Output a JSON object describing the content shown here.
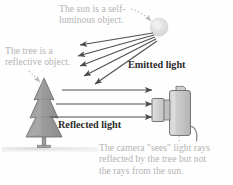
{
  "figure": {
    "background_color": "#fefefe"
  },
  "captions": {
    "sun": "The sun is a self-\nluminous object.",
    "tree": "The tree is a\nreflective object.",
    "camera": "The camera \"sees\" light rays\nreflected by the tree but not\nthe rays from the sun."
  },
  "labels": {
    "emitted_light": "Emitted light",
    "reflected_light": "Reflected light"
  },
  "colors": {
    "caption_text": "#b3b3b3",
    "label_text": "#2b2b2b",
    "sun_fill": "#dcdcdc",
    "tree_fill": "#9b9b9b",
    "tree_stroke": "#6e6e6e",
    "camera_fill": "#c9c9c9",
    "camera_stroke": "#6b6b6b",
    "arrow_stroke": "#4a4a4a",
    "ground_fill": "#e3e3e3",
    "leader_stroke": "#bdbdbd"
  },
  "objects": {
    "sun": {
      "name": "sun",
      "cx": 159,
      "cy": 27,
      "r": 9
    },
    "tree": {
      "name": "pine-tree",
      "x": 44,
      "y": 80
    },
    "camera": {
      "name": "camera",
      "x": 170,
      "y": 110
    },
    "ground": {
      "name": "ground-line"
    }
  },
  "rays": {
    "emitted_count": 5,
    "reflected_count": 3
  }
}
